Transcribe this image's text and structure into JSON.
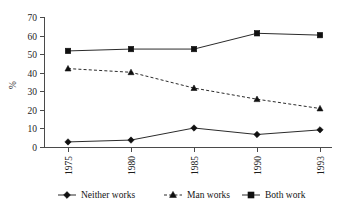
{
  "chart_data": {
    "type": "line",
    "title": "",
    "xlabel": "",
    "ylabel": "%",
    "x": [
      "1975",
      "1980",
      "1985",
      "1990",
      "1993"
    ],
    "categories": [
      "1975",
      "1980",
      "1985",
      "1990",
      "1993"
    ],
    "ylim": [
      0,
      70
    ],
    "yticks": [
      0,
      10,
      20,
      30,
      40,
      50,
      60,
      70
    ],
    "ytick_labels": [
      "0",
      "10",
      "20",
      "30",
      "40",
      "50",
      "60",
      "70"
    ],
    "grid": false,
    "legend_position": "bottom",
    "series": [
      {
        "name": "Neither works",
        "values": [
          3,
          4,
          10.5,
          7,
          9.5
        ],
        "marker": "diamond",
        "line_style": "solid",
        "color": "#2b2b2b"
      },
      {
        "name": "Man works",
        "values": [
          42.5,
          40.5,
          32,
          26,
          21
        ],
        "marker": "triangle",
        "line_style": "dashed",
        "color": "#2b2b2b"
      },
      {
        "name": "Both work",
        "values": [
          52,
          53,
          53,
          61.5,
          60.5
        ],
        "marker": "square",
        "line_style": "solid",
        "color": "#2b2b2b"
      }
    ]
  },
  "axes": {
    "y_axis_title": "%",
    "y_tick_labels": [
      "70",
      "60",
      "50",
      "40",
      "30",
      "20",
      "10",
      "0"
    ],
    "x_tick_labels": [
      "1975",
      "1980",
      "1985",
      "1990",
      "1993"
    ]
  },
  "legend": {
    "items": [
      {
        "label": "Neither works",
        "marker": "diamond-marker",
        "line_style": "solid"
      },
      {
        "label": "Man works",
        "marker": "triangle-marker",
        "line_style": "dashed"
      },
      {
        "label": "Both work",
        "marker": "square-marker",
        "line_style": "solid"
      }
    ]
  },
  "colors": {
    "background": "#ffffff",
    "ink": "#1a1a1a",
    "axis": "#4a4a4a",
    "series": "#2b2b2b"
  }
}
